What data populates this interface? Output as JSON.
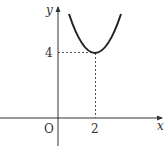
{
  "diagram": {
    "type": "function-graph",
    "axes": {
      "x_label": "x",
      "y_label": "y",
      "origin_label": "O"
    },
    "ticks": {
      "x_tick_label": "2",
      "y_tick_label": "4"
    },
    "vertex": {
      "x": 2,
      "y": 4
    },
    "colors": {
      "curve": "#222222",
      "axes": "#333333",
      "dashed": "#555555"
    }
  }
}
